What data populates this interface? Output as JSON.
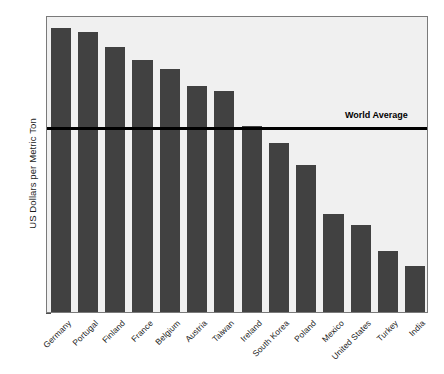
{
  "chart_data": {
    "type": "bar",
    "title": "",
    "xlabel": "",
    "ylabel": "US Dollars per Metric Ton",
    "ylim": [
      0,
      160
    ],
    "ytick_step": 20,
    "yticks": [
      0,
      20,
      40,
      60,
      80,
      100,
      120,
      140,
      160
    ],
    "grid": false,
    "legend": "none",
    "bar_color": "#414141",
    "plot_background": "#f0f0f0",
    "categories": [
      "Germany",
      "Portugal",
      "Finland",
      "France",
      "Belgium",
      "Austria",
      "Taiwan",
      "Ireland",
      "South Korea",
      "Poland",
      "Mexico",
      "United States",
      "Turkey",
      "India"
    ],
    "values": [
      153,
      151,
      143,
      136,
      131,
      122,
      119,
      100,
      91,
      79,
      53,
      47,
      33,
      25
    ],
    "annotations": [
      {
        "label": "World Average",
        "type": "horizontal-reference-line",
        "value": 100,
        "color": "#000000",
        "label_position": "top-right"
      }
    ]
  }
}
